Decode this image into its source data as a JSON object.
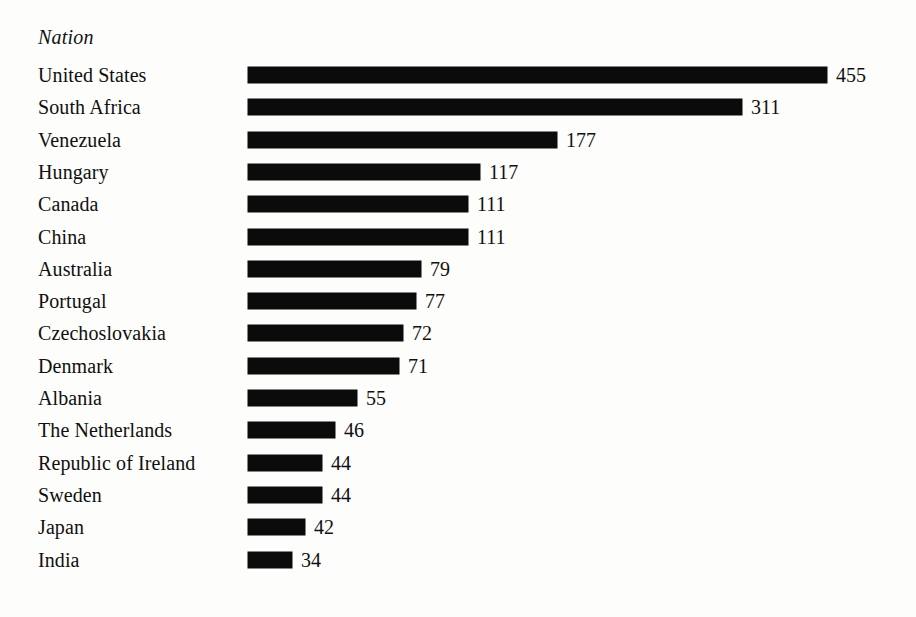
{
  "chart_data": {
    "type": "bar",
    "orientation": "horizontal",
    "title": "",
    "subtitle": "",
    "xlabel": "",
    "ylabel": "Nation",
    "grid": false,
    "legend": null,
    "axis_visible": false,
    "value_labels_shown": true,
    "xlim": [
      0,
      455
    ],
    "categories": [
      "United States",
      "South Africa",
      "Venezuela",
      "Hungary",
      "Canada",
      "China",
      "Australia",
      "Portugal",
      "Czechoslovakia",
      "Denmark",
      "Albania",
      "The Netherlands",
      "Republic of Ireland",
      "Sweden",
      "Japan",
      "India"
    ],
    "values": [
      455,
      311,
      177,
      117,
      111,
      111,
      79,
      77,
      72,
      71,
      55,
      46,
      44,
      44,
      42,
      34
    ],
    "bar_color": "#0b0b0b",
    "background_color": "#fdfdfb"
  },
  "header": {
    "column_title": "Nation"
  },
  "rows": [
    {
      "label": "United States",
      "value": "455",
      "px": 579
    },
    {
      "label": "South Africa",
      "value": "311",
      "px": 494
    },
    {
      "label": "Venezuela",
      "value": "177",
      "px": 309
    },
    {
      "label": "Hungary",
      "value": "117",
      "px": 232
    },
    {
      "label": "Canada",
      "value": "111",
      "px": 220
    },
    {
      "label": "China",
      "value": "111",
      "px": 220
    },
    {
      "label": "Australia",
      "value": "79",
      "px": 173
    },
    {
      "label": "Portugal",
      "value": "77",
      "px": 168
    },
    {
      "label": "Czechoslovakia",
      "value": "72",
      "px": 155
    },
    {
      "label": "Denmark",
      "value": "71",
      "px": 151
    },
    {
      "label": "Albania",
      "value": "55",
      "px": 109
    },
    {
      "label": "The Netherlands",
      "value": "46",
      "px": 87
    },
    {
      "label": "Republic of Ireland",
      "value": "44",
      "px": 74
    },
    {
      "label": "Sweden",
      "value": "44",
      "px": 74
    },
    {
      "label": "Japan",
      "value": "42",
      "px": 57
    },
    {
      "label": "India",
      "value": "34",
      "px": 44
    }
  ],
  "layout": {
    "first_row_top": 59,
    "row_pitch": 32.3
  }
}
